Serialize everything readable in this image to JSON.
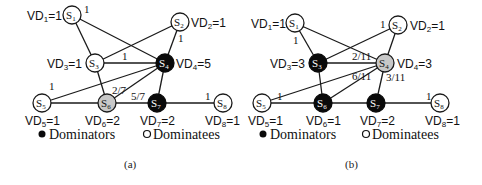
{
  "legend": {
    "dominators": "Dominators",
    "dominatees": "Dominatees"
  },
  "colors": {
    "dominator": "#0a0a0a",
    "dominatee": "#ffffff",
    "highlighted": "#c8c8c8",
    "edge": "#1a1a1a"
  },
  "panels": [
    {
      "caption": "(a)",
      "nodes": [
        {
          "id": "S1",
          "sub": "1",
          "vd": "VD1=1",
          "type": "dominatee"
        },
        {
          "id": "S2",
          "sub": "2",
          "vd": "VD2=1",
          "type": "dominatee"
        },
        {
          "id": "S3",
          "sub": "3",
          "vd": "VD3=1",
          "type": "dominatee"
        },
        {
          "id": "S4",
          "sub": "4",
          "vd": "VD4=5",
          "type": "dominator"
        },
        {
          "id": "S5",
          "sub": "5",
          "vd": "VD5=1",
          "type": "dominatee"
        },
        {
          "id": "S6",
          "sub": "6",
          "vd": "VD6=2",
          "type": "highlighted"
        },
        {
          "id": "S7",
          "sub": "7",
          "vd": "VD7=2",
          "type": "dominator"
        },
        {
          "id": "S8",
          "sub": "8",
          "vd": "VD8=1",
          "type": "dominatee"
        }
      ],
      "weights": {
        "s1_s4": "1",
        "s2_s4": "1",
        "s3_s4": "1",
        "s4_s5": "1",
        "s4_s6": "2/7",
        "s4_s7": "5/7",
        "s7_s8": "1"
      }
    },
    {
      "caption": "(b)",
      "nodes": [
        {
          "id": "S1",
          "sub": "1",
          "vd": "VD1=1",
          "type": "dominatee"
        },
        {
          "id": "S2",
          "sub": "2",
          "vd": "VD2=1",
          "type": "dominatee"
        },
        {
          "id": "S3",
          "sub": "3",
          "vd": "VD3=3",
          "type": "dominator"
        },
        {
          "id": "S4",
          "sub": "4",
          "vd": "VD4=3",
          "type": "highlighted"
        },
        {
          "id": "S5",
          "sub": "5",
          "vd": "VD5=1",
          "type": "dominatee"
        },
        {
          "id": "S6",
          "sub": "6",
          "vd": "VD6=1",
          "type": "dominator"
        },
        {
          "id": "S7",
          "sub": "7",
          "vd": "VD7=2",
          "type": "dominator"
        },
        {
          "id": "S8",
          "sub": "8",
          "vd": "VD8=1",
          "type": "dominatee"
        }
      ],
      "weights": {
        "s1_s3": "1",
        "s2_s3": "1",
        "s3_s4": "2/11",
        "s4_s5": "6/11",
        "s4_s7": "3/11",
        "s5_s6": "1",
        "s7_s8": "1"
      }
    }
  ]
}
